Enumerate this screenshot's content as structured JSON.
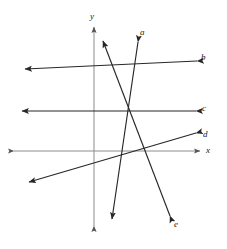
{
  "figure": {
    "type": "coordinate-plane-line-diagram",
    "width": 227,
    "height": 249,
    "background_color": "#ffffff",
    "origin": {
      "x": 130,
      "y": 111
    },
    "line_color": "#272727",
    "axis_color": "#8c8c8c",
    "label_color": "#1a1a1a"
  },
  "axes": {
    "x_axis": {
      "label": "x",
      "label_x": 206,
      "label_y": 146,
      "y": 151,
      "x_start": 14,
      "x_end": 200,
      "color": "#8c8c8c",
      "arrow_start": true,
      "arrow_end": true
    },
    "y_axis": {
      "label": "y",
      "label_x": 90,
      "label_y": 12,
      "x": 94,
      "y_start": 27,
      "y_end": 226,
      "color": "#8c8c8c",
      "arrow_start": true,
      "arrow_end": true
    }
  },
  "lines": [
    {
      "id": "line-a",
      "label": "a",
      "label_x": 140,
      "label_y": 28,
      "x1": 138,
      "y1": 42,
      "x2": 112,
      "y2": 219,
      "color": "#272727",
      "arrow_start": true,
      "arrow_end": true
    },
    {
      "id": "line-b",
      "label": "b",
      "label_x": 201,
      "label_y": 53,
      "x1": 197,
      "y1": 61,
      "x2": 25,
      "y2": 69,
      "color": "#272727",
      "arrow_start": true,
      "arrow_end": true
    },
    {
      "id": "line-c",
      "label": "c",
      "label_x": 202,
      "label_y": 104,
      "x1": 196,
      "y1": 111,
      "x2": 22,
      "y2": 111,
      "color": "#272727",
      "arrow_start": true,
      "arrow_end": true
    },
    {
      "id": "line-d",
      "label": "d",
      "label_x": 203,
      "label_y": 130,
      "x1": 196,
      "y1": 133,
      "x2": 29,
      "y2": 182,
      "color": "#272727",
      "arrow_start": true,
      "arrow_end": true
    },
    {
      "id": "line-e",
      "label": "e",
      "label_x": 174,
      "label_y": 220,
      "x1": 170,
      "y1": 216,
      "x2": 103,
      "y2": 41,
      "color": "#272727",
      "arrow_start": true,
      "arrow_end": true
    }
  ]
}
